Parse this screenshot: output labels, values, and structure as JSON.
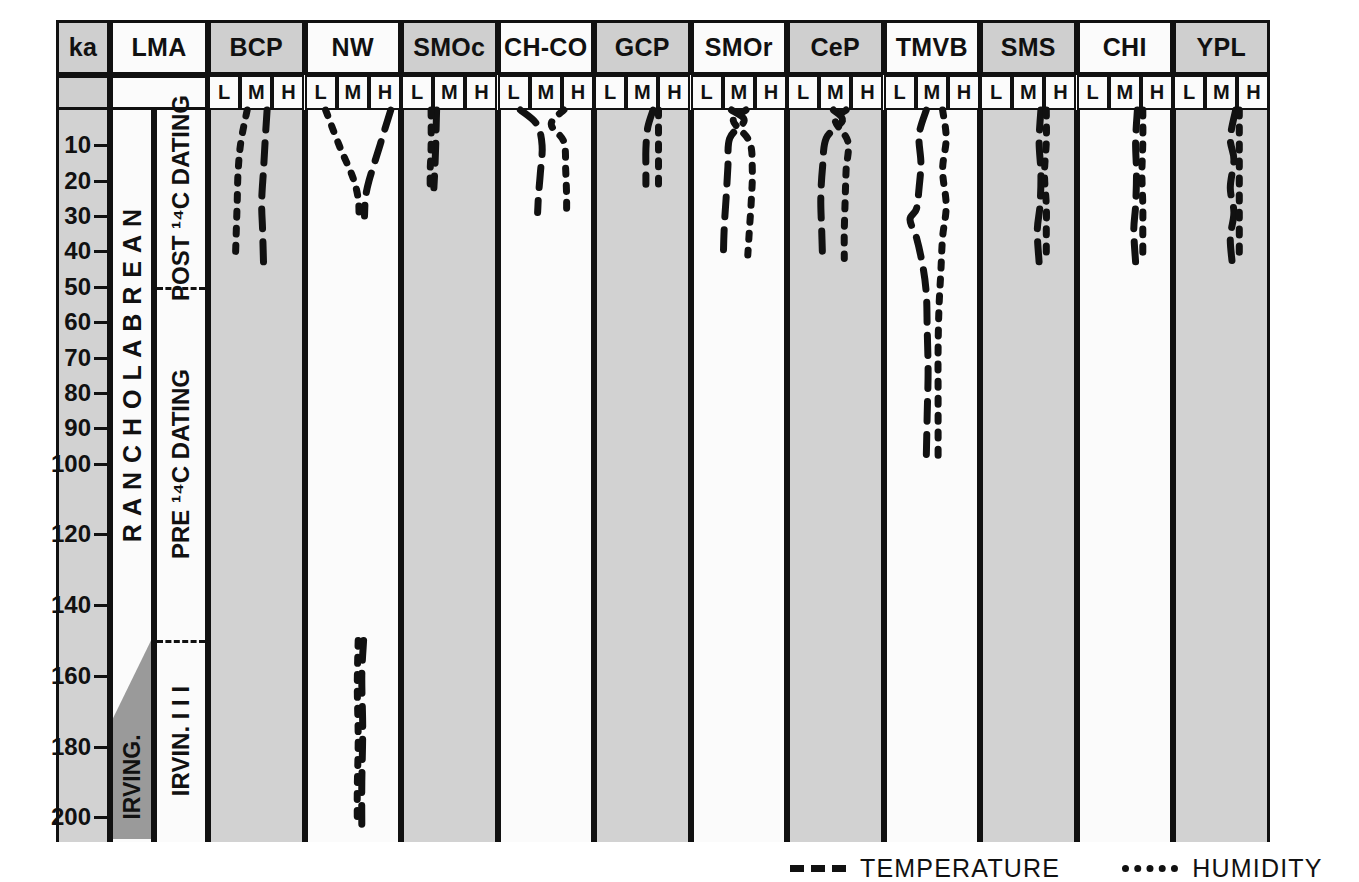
{
  "axis": {
    "title": "ka",
    "lma_title": "LMA",
    "ticks": [
      10,
      20,
      30,
      40,
      50,
      60,
      70,
      80,
      90,
      100,
      120,
      140,
      160,
      180,
      200
    ],
    "range_top": 0,
    "range_bottom": 207
  },
  "lma": {
    "stage_label": "R A N C H O L A B R E A N",
    "irvington_label": "IRVING.",
    "dating_post": "POST ¹⁴C DATING",
    "dating_pre": "PRE ¹⁴C DATING",
    "irvington_sub": "IRVIN. I I I",
    "divider_ka": 50,
    "wedge_top_ka": 150,
    "wedge_bottom_ka": 172
  },
  "subheaders": [
    "L",
    "M",
    "H"
  ],
  "legend": {
    "temperature": "TEMPERATURE",
    "humidity": "HUMIDITY",
    "temperature_icon": "dashed-line-icon",
    "humidity_icon": "dotted-line-icon"
  },
  "colors": {
    "gray_column": "#d2d2d2",
    "white_column": "#fbfbfb",
    "header_gray": "#cfcfcf",
    "wedge_gray": "#9a9a9a",
    "ink": "#111111"
  },
  "chart_data": {
    "type": "line",
    "xlabel": "",
    "ylabel": "ka",
    "ylim": [
      0,
      207
    ],
    "y_inverted": true,
    "grid": false,
    "legend_position": "bottom-right",
    "x_categories": [
      "L",
      "M",
      "H"
    ],
    "x_note": "Each region panel is divided into three qualitative classes: L (low), M (medium), H (high)",
    "series_types": [
      "TEMPERATURE (dashed)",
      "HUMIDITY (dotted)"
    ],
    "regions": [
      {
        "name": "BCP",
        "shaded": true,
        "temperature": [
          [
            0.62,
            0
          ],
          [
            0.6,
            8
          ],
          [
            0.58,
            17
          ],
          [
            0.56,
            26
          ],
          [
            0.57,
            34
          ],
          [
            0.58,
            43
          ]
        ],
        "humidity": [
          [
            0.4,
            0
          ],
          [
            0.33,
            9
          ],
          [
            0.3,
            17
          ],
          [
            0.29,
            26
          ],
          [
            0.28,
            34
          ],
          [
            0.27,
            42
          ]
        ]
      },
      {
        "name": "NW",
        "shaded": false,
        "temperature": [
          [
            0.92,
            0
          ],
          [
            0.8,
            10
          ],
          [
            0.68,
            20
          ],
          [
            0.64,
            25
          ],
          [
            0.63,
            30
          ]
        ],
        "humidity": [
          [
            0.2,
            0
          ],
          [
            0.35,
            10
          ],
          [
            0.5,
            19
          ],
          [
            0.56,
            25
          ],
          [
            0.57,
            30
          ]
        ],
        "temperature_lower": [
          [
            0.62,
            150
          ],
          [
            0.6,
            160
          ],
          [
            0.61,
            175
          ],
          [
            0.6,
            190
          ],
          [
            0.6,
            202
          ]
        ],
        "humidity_lower": [
          [
            0.56,
            150
          ],
          [
            0.55,
            163
          ],
          [
            0.56,
            178
          ],
          [
            0.55,
            192
          ],
          [
            0.55,
            202
          ]
        ]
      },
      {
        "name": "SMOc",
        "shaded": true,
        "temperature": [
          [
            0.36,
            0
          ],
          [
            0.35,
            10
          ],
          [
            0.34,
            17
          ],
          [
            0.33,
            22
          ]
        ],
        "humidity": [
          [
            0.3,
            0
          ],
          [
            0.3,
            10
          ],
          [
            0.29,
            17
          ],
          [
            0.29,
            22
          ]
        ]
      },
      {
        "name": "CH-CO",
        "shaded": false,
        "temperature": [
          [
            0.22,
            0
          ],
          [
            0.4,
            4
          ],
          [
            0.46,
            10
          ],
          [
            0.44,
            18
          ],
          [
            0.42,
            24
          ],
          [
            0.41,
            29
          ]
        ],
        "humidity": [
          [
            0.7,
            0
          ],
          [
            0.56,
            4
          ],
          [
            0.7,
            9
          ],
          [
            0.72,
            17
          ],
          [
            0.73,
            24
          ],
          [
            0.73,
            29
          ]
        ]
      },
      {
        "name": "GCP",
        "shaded": true,
        "temperature": [
          [
            0.62,
            0
          ],
          [
            0.56,
            5
          ],
          [
            0.54,
            11
          ],
          [
            0.54,
            16
          ],
          [
            0.54,
            21
          ]
        ],
        "humidity": [
          [
            0.68,
            0
          ],
          [
            0.68,
            7
          ],
          [
            0.68,
            14
          ],
          [
            0.68,
            21
          ]
        ]
      },
      {
        "name": "SMOr",
        "shaded": false,
        "temperature": [
          [
            0.42,
            0
          ],
          [
            0.56,
            3
          ],
          [
            0.4,
            8
          ],
          [
            0.38,
            16
          ],
          [
            0.36,
            25
          ],
          [
            0.34,
            33
          ],
          [
            0.33,
            41
          ]
        ],
        "humidity": [
          [
            0.58,
            0
          ],
          [
            0.44,
            3
          ],
          [
            0.62,
            9
          ],
          [
            0.65,
            17
          ],
          [
            0.64,
            25
          ],
          [
            0.62,
            33
          ],
          [
            0.6,
            41
          ]
        ]
      },
      {
        "name": "CeP",
        "shaded": true,
        "temperature": [
          [
            0.48,
            0
          ],
          [
            0.58,
            3
          ],
          [
            0.4,
            8
          ],
          [
            0.36,
            16
          ],
          [
            0.34,
            25
          ],
          [
            0.35,
            34
          ],
          [
            0.36,
            42
          ]
        ],
        "humidity": [
          [
            0.62,
            0
          ],
          [
            0.5,
            3
          ],
          [
            0.64,
            9
          ],
          [
            0.62,
            17
          ],
          [
            0.61,
            25
          ],
          [
            0.6,
            34
          ],
          [
            0.6,
            42
          ]
        ]
      },
      {
        "name": "TMVB",
        "shaded": false,
        "temperature": [
          [
            0.44,
            0
          ],
          [
            0.36,
            7
          ],
          [
            0.38,
            15
          ],
          [
            0.36,
            22
          ],
          [
            0.33,
            28
          ],
          [
            0.26,
            31
          ],
          [
            0.33,
            36
          ],
          [
            0.4,
            44
          ],
          [
            0.44,
            52
          ],
          [
            0.45,
            62
          ],
          [
            0.46,
            74
          ],
          [
            0.45,
            86
          ],
          [
            0.44,
            98
          ]
        ],
        "humidity": [
          [
            0.62,
            0
          ],
          [
            0.66,
            8
          ],
          [
            0.62,
            17
          ],
          [
            0.66,
            27
          ],
          [
            0.62,
            36
          ],
          [
            0.6,
            46
          ],
          [
            0.58,
            56
          ],
          [
            0.57,
            68
          ],
          [
            0.57,
            80
          ],
          [
            0.57,
            90
          ],
          [
            0.57,
            98
          ]
        ]
      },
      {
        "name": "SMS",
        "shaded": true,
        "temperature": [
          [
            0.64,
            0
          ],
          [
            0.62,
            9
          ],
          [
            0.64,
            18
          ],
          [
            0.63,
            27
          ],
          [
            0.6,
            34
          ],
          [
            0.62,
            43
          ]
        ],
        "humidity": [
          [
            0.7,
            0
          ],
          [
            0.7,
            9
          ],
          [
            0.68,
            18
          ],
          [
            0.7,
            27
          ],
          [
            0.7,
            34
          ],
          [
            0.7,
            43
          ]
        ]
      },
      {
        "name": "CHI",
        "shaded": false,
        "temperature": [
          [
            0.64,
            0
          ],
          [
            0.62,
            9
          ],
          [
            0.63,
            18
          ],
          [
            0.62,
            27
          ],
          [
            0.6,
            34
          ],
          [
            0.62,
            43
          ]
        ],
        "humidity": [
          [
            0.7,
            0
          ],
          [
            0.7,
            9
          ],
          [
            0.69,
            18
          ],
          [
            0.7,
            27
          ],
          [
            0.7,
            34
          ],
          [
            0.7,
            43
          ]
        ]
      },
      {
        "name": "YPL",
        "shaded": true,
        "temperature": [
          [
            0.66,
            0
          ],
          [
            0.6,
            8
          ],
          [
            0.64,
            14
          ],
          [
            0.6,
            22
          ],
          [
            0.64,
            29
          ],
          [
            0.6,
            36
          ],
          [
            0.62,
            43
          ]
        ],
        "humidity": [
          [
            0.7,
            0
          ],
          [
            0.7,
            9
          ],
          [
            0.7,
            18
          ],
          [
            0.7,
            27
          ],
          [
            0.7,
            35
          ],
          [
            0.7,
            43
          ]
        ]
      }
    ]
  }
}
